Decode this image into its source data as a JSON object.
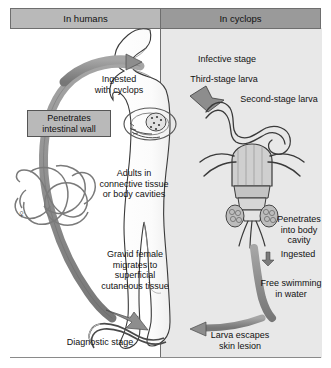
{
  "figure": {
    "panels": [
      {
        "id": "humans",
        "label": "In humans",
        "header_color": "#b9b9b9",
        "bg_color": "#ffffff"
      },
      {
        "id": "cyclops",
        "label": "In cyclops",
        "header_color": "#9a9a9a",
        "bg_color": "#e8e8e8"
      }
    ],
    "labels": {
      "ingested_with_cyclops": "Ingested\nwith cyclops",
      "penetrates_intestinal_wall": "Penetrates\nintestinal wall",
      "adults_connective": "Adults in\nconnective tissue\nor body cavities",
      "gravid_female": "Gravid female\nmigrates to\nsuperficial\ncutaneous tissue",
      "diagnostic_stage": "Diagnostic stage",
      "infective_stage": "Infective stage",
      "third_stage_larva": "Third-stage larva",
      "second_stage_larva": "Second-stage larva",
      "penetrates_body_cavity": "Penetrates\ninto body\ncavity",
      "ingested": "Ingested",
      "free_swimming": "Free swimming\nin water",
      "larva_escapes": "Larva escapes\nskin lesion"
    },
    "symbols": {
      "female": "♀"
    },
    "illustrations": [
      {
        "name": "human-silhouette",
        "description": "white human body profile with head, torso, legs"
      },
      {
        "name": "adult-worm-coil",
        "description": "coiled adult female guinea worm in connective tissue"
      },
      {
        "name": "cyclops-copepod",
        "description": "copepod carrying larvae"
      },
      {
        "name": "larva-in-mouth",
        "description": "ingested cyclops with larva near mouth"
      },
      {
        "name": "emerging-larva",
        "description": "larva escaping skin lesion at foot"
      }
    ],
    "colors": {
      "arrow": "#8d8d8d",
      "arrow_stroke": "#4a4a4a",
      "panel_border": "#6e6e6e",
      "panel_gray": "#e8e8e8",
      "header_light": "#b9b9b9",
      "header_dark": "#9a9a9a",
      "text": "#111111"
    }
  }
}
